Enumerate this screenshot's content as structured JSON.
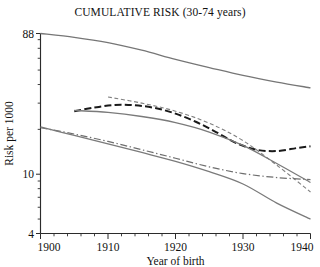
{
  "chart_data": {
    "type": "line",
    "title": "CUMULATIVE RISK (30-74 years)",
    "xlabel": "Year of birth",
    "ylabel": "Risk per 1000",
    "xlim": [
      1900,
      1940
    ],
    "ylim": [
      4,
      88
    ],
    "yscale": "log",
    "grid": false,
    "legend": "none",
    "xticks": [
      1900,
      1910,
      1920,
      1930,
      1940
    ],
    "xtick_labels": [
      "1900",
      "1910",
      "1920",
      "1930",
      "1940"
    ],
    "xtick_minor_step": 2,
    "yticks": [
      88,
      10,
      4
    ],
    "ytick_labels": [
      "88",
      "10",
      "4"
    ],
    "ytick_minor": [
      80,
      70,
      60,
      50,
      40,
      30,
      20,
      9,
      8,
      7,
      6,
      5
    ],
    "series": [
      {
        "name": "top-solid-curve",
        "style": "solid",
        "color": "#767676",
        "width": 1.3,
        "x": [
          1900,
          1905,
          1910,
          1915,
          1920,
          1925,
          1930,
          1935,
          1940
        ],
        "y": [
          88.0,
          83.0,
          76.5,
          68.0,
          59.0,
          52.0,
          46.0,
          41.5,
          38.0
        ]
      },
      {
        "name": "thick-dashed-curve",
        "style": "dashed",
        "color": "#1a1a1a",
        "width": 2.0,
        "x": [
          1905,
          1908,
          1911,
          1914,
          1917,
          1920,
          1923,
          1926,
          1929,
          1932,
          1935,
          1938,
          1940
        ],
        "y": [
          26.5,
          28.0,
          29.2,
          29.0,
          27.8,
          25.5,
          22.5,
          19.2,
          16.2,
          14.6,
          14.3,
          15.0,
          15.4
        ]
      },
      {
        "name": "fine-dashed-curve",
        "style": "fine-dashed",
        "color": "#808080",
        "width": 1.1,
        "x": [
          1910,
          1915,
          1920,
          1925,
          1930,
          1935,
          1940
        ],
        "y": [
          33.0,
          30.0,
          26.5,
          22.0,
          16.8,
          11.5,
          7.6
        ]
      },
      {
        "name": "upper-solid-curve",
        "style": "solid",
        "color": "#7a7a7a",
        "width": 1.3,
        "x": [
          1905,
          1910,
          1915,
          1920,
          1925,
          1930,
          1935,
          1940
        ],
        "y": [
          26.8,
          26.0,
          24.4,
          22.2,
          19.2,
          15.6,
          11.8,
          8.8
        ]
      },
      {
        "name": "dash-dot-curve",
        "style": "dash-dot",
        "color": "#6e6e6e",
        "width": 1.2,
        "x": [
          1900,
          1905,
          1910,
          1915,
          1920,
          1925,
          1930,
          1935,
          1940
        ],
        "y": [
          20.5,
          18.6,
          16.6,
          14.6,
          12.8,
          11.2,
          10.1,
          9.5,
          9.2
        ]
      },
      {
        "name": "lower-solid-curve",
        "style": "solid",
        "color": "#7a7a7a",
        "width": 1.3,
        "x": [
          1900,
          1905,
          1910,
          1915,
          1920,
          1925,
          1930,
          1935,
          1940
        ],
        "y": [
          20.8,
          18.2,
          16.0,
          14.0,
          12.2,
          10.4,
          8.6,
          6.4,
          5.0
        ]
      }
    ]
  }
}
